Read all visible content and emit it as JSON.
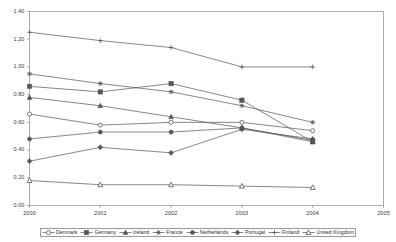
{
  "chart_data": {
    "type": "line",
    "title": "",
    "xlabel": "",
    "ylabel": "",
    "x": [
      2000,
      2001,
      2002,
      2003,
      2004
    ],
    "xtick_labels": [
      "2000",
      "2001",
      "2002",
      "2003",
      "2004",
      "2005"
    ],
    "xlim": [
      2000,
      2005
    ],
    "ytick_labels": [
      "0.00",
      "0.20",
      "0.40",
      "0.60",
      "0.80",
      "1.00",
      "1.20",
      "1.40"
    ],
    "ylim": [
      0.0,
      1.4
    ],
    "grid": false,
    "legend_position": "bottom",
    "series": [
      {
        "name": "Denmark",
        "marker": "circle-open",
        "values": [
          0.66,
          0.58,
          0.6,
          0.6,
          0.54
        ]
      },
      {
        "name": "Germany",
        "marker": "square-filled",
        "values": [
          0.86,
          0.82,
          0.88,
          0.76,
          0.46
        ]
      },
      {
        "name": "Ireland",
        "marker": "triangle-filled",
        "values": [
          0.78,
          0.72,
          0.64,
          0.56,
          0.46
        ]
      },
      {
        "name": "France",
        "marker": "star",
        "values": [
          0.95,
          0.88,
          0.82,
          0.72,
          0.6
        ]
      },
      {
        "name": "Netherlands",
        "marker": "circle-filled",
        "values": [
          0.48,
          0.53,
          0.53,
          0.56,
          0.47
        ]
      },
      {
        "name": "Portugal",
        "marker": "diamond-filled",
        "values": [
          0.32,
          0.42,
          0.38,
          0.55,
          0.48
        ]
      },
      {
        "name": "Finland",
        "marker": "plus",
        "values": [
          1.25,
          1.19,
          1.14,
          1.0,
          1.0
        ]
      },
      {
        "name": "United Kingdom",
        "marker": "triangle-open",
        "values": [
          0.18,
          0.15,
          0.15,
          0.14,
          0.13
        ]
      }
    ]
  },
  "legend": {
    "items": [
      {
        "label": "Denmark"
      },
      {
        "label": "Germany"
      },
      {
        "label": "Ireland"
      },
      {
        "label": "France"
      },
      {
        "label": "Netherlands"
      },
      {
        "label": "Portugal"
      },
      {
        "label": "Finland"
      },
      {
        "label": "United Kingdom"
      }
    ]
  },
  "colors": {
    "line": "#555555",
    "axis": "#888888",
    "text": "#333333",
    "frame": "#9a9a9a"
  }
}
